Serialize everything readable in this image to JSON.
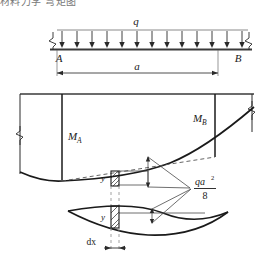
{
  "figure": {
    "title_fragment": "材料力学 弯矩图",
    "type": "engineering-beam-bending-moment-diagram",
    "colors": {
      "line": "#1a1a1a",
      "beam": "#3a3a3a",
      "dashed": "#555555",
      "hatch": "#2a2a2a",
      "background": "#ffffff",
      "text": "#1a1a1a"
    }
  },
  "beam_panel": {
    "load_label": "q",
    "support_left_label": "A",
    "support_right_label": "B",
    "span_label": "a",
    "load_arrow_count": 13
  },
  "moment_panel": {
    "moment_left_label": "M",
    "moment_left_sub": "A",
    "moment_right_label": "M",
    "moment_right_sub": "B",
    "ordinate_label": "y",
    "parabola_peak_label_num": "qa",
    "parabola_peak_label_sup": "2",
    "parabola_peak_label_den": "8"
  },
  "element_panel": {
    "ordinate_label": "y",
    "width_label": "dx"
  }
}
